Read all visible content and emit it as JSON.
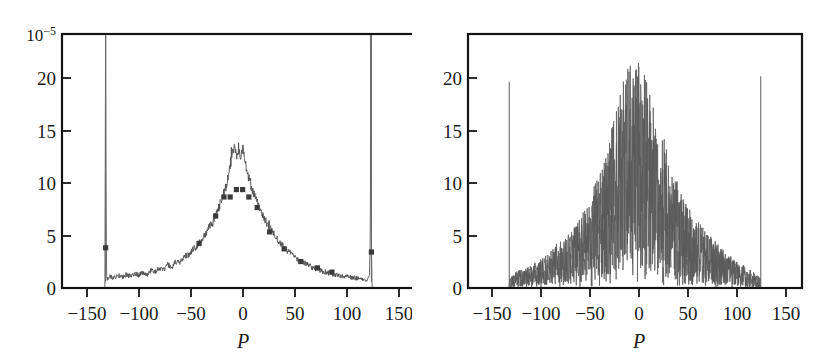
{
  "figure": {
    "background_color": "#ffffff",
    "trace_color": "#4a4a4a",
    "axis_color": "#141414"
  },
  "chart_data": [
    {
      "type": "line",
      "panel": "left",
      "title": "",
      "xlabel": "P",
      "ylabel": "",
      "scale_label": "10^-5",
      "scale_label_display": "10",
      "scale_exponent": "−5",
      "xlim": [
        -170,
        170
      ],
      "ylim": [
        0,
        24
      ],
      "xticks": [
        -150,
        -100,
        -50,
        0,
        50,
        100,
        150
      ],
      "xticklabels": [
        "−150",
        "−100",
        "−50",
        "0",
        "50",
        "100",
        "150"
      ],
      "yticks": [
        0,
        5,
        10,
        15,
        20
      ],
      "yticklabels": [
        "0",
        "5",
        "10",
        "15",
        "20"
      ],
      "grid": false,
      "legend": "none",
      "description": "Smooth noisy bell-shaped distribution peaking near P=0 at about 13-14, with a flat noisy plateau near 1 between the cutoffs, and two tall narrow spikes at P=-128 and P=+128 which run off the top of the frame. Square markers overlay the curve at several P values.",
      "x": [
        -170,
        -160,
        -150,
        -140,
        -132,
        -129,
        -128.5,
        -128,
        -127.5,
        -127,
        -126,
        -124,
        -120,
        -116,
        -112,
        -108,
        -104,
        -100,
        -96,
        -92,
        -88,
        -84,
        -80,
        -76,
        -72,
        -68,
        -64,
        -60,
        -56,
        -52,
        -48,
        -44,
        -40,
        -36,
        -32,
        -28,
        -24,
        -20,
        -16,
        -12,
        -8,
        -6,
        -4,
        -2,
        0,
        2,
        4,
        6,
        8,
        12,
        16,
        20,
        24,
        28,
        32,
        36,
        40,
        44,
        48,
        52,
        56,
        60,
        64,
        68,
        72,
        76,
        80,
        84,
        88,
        92,
        96,
        100,
        104,
        108,
        112,
        116,
        120,
        124,
        126,
        127,
        127.5,
        128,
        128.5,
        129,
        132,
        140,
        150,
        160,
        170
      ],
      "y": [
        0.05,
        0.05,
        0.05,
        0.06,
        0.08,
        0.5,
        6,
        24,
        6,
        1.0,
        0.9,
        1.1,
        0.95,
        1.2,
        1.0,
        1.3,
        1.1,
        1.4,
        1.2,
        1.5,
        1.3,
        1.7,
        1.5,
        1.9,
        1.7,
        2.2,
        2.0,
        2.5,
        2.4,
        3.0,
        3.1,
        3.6,
        4.0,
        4.6,
        5.0,
        5.8,
        6.4,
        7.3,
        8.4,
        9.6,
        11.5,
        12.6,
        13.3,
        12.4,
        13.0,
        12.2,
        13.4,
        12.1,
        11.0,
        9.6,
        8.8,
        7.6,
        6.7,
        6.0,
        5.4,
        4.8,
        4.3,
        3.8,
        3.4,
        3.1,
        2.8,
        2.5,
        2.3,
        2.1,
        1.9,
        1.8,
        1.6,
        1.5,
        1.4,
        1.3,
        1.2,
        1.1,
        1.05,
        1.0,
        0.95,
        0.9,
        0.85,
        0.8,
        1.0,
        5,
        24,
        5,
        0.6,
        0.08,
        0.06,
        0.05,
        0.05,
        0.05,
        0.05
      ],
      "markers_x": [
        -128,
        -38,
        -22,
        -14,
        -8,
        -2,
        4,
        10,
        18,
        30,
        44,
        60,
        76,
        90,
        128
      ],
      "markers_y": [
        3.8,
        4.2,
        6.8,
        8.6,
        8.6,
        9.3,
        9.3,
        8.6,
        7.6,
        5.3,
        3.7,
        2.5,
        1.9,
        1.5,
        3.4
      ]
    },
    {
      "type": "line",
      "panel": "right",
      "title": "",
      "xlabel": "P",
      "ylabel": "",
      "scale_label": "",
      "xlim": [
        -170,
        170
      ],
      "ylim": [
        0,
        24
      ],
      "xticks": [
        -150,
        -100,
        -50,
        0,
        50,
        100,
        150
      ],
      "xticklabels": [
        "−150",
        "−100",
        "−50",
        "0",
        "50",
        "100",
        "150"
      ],
      "yticks": [
        0,
        5,
        10,
        15,
        20
      ],
      "yticklabels": [
        "0",
        "5",
        "10",
        "15",
        "20"
      ],
      "grid": false,
      "legend": "none",
      "description": "Highly fluctuating dense spectrum forming a broad triangular envelope peaking near P=0 at about 21-22, decaying to near 0 at the cutoffs P=+/-128, with isolated tall narrow spikes at P=-128 (reaching ~19.5) and P=+128 (reaching ~20).",
      "envelope_x": [
        -128,
        -120,
        -110,
        -100,
        -90,
        -80,
        -70,
        -60,
        -50,
        -40,
        -30,
        -20,
        -10,
        -5,
        0,
        5,
        10,
        20,
        30,
        40,
        50,
        60,
        70,
        80,
        90,
        100,
        110,
        120,
        128
      ],
      "envelope_upper": [
        1.0,
        1.6,
        2.0,
        2.6,
        3.2,
        4.2,
        4.8,
        6.0,
        7.6,
        10.0,
        13.0,
        17.0,
        20.5,
        21.6,
        21.0,
        21.8,
        20.8,
        16.5,
        14.0,
        11.0,
        8.6,
        7.0,
        5.6,
        4.6,
        3.6,
        2.8,
        2.2,
        1.6,
        1.0
      ],
      "envelope_lower": [
        0.05,
        0.1,
        0.15,
        0.2,
        0.3,
        0.35,
        0.4,
        0.5,
        0.6,
        0.8,
        1.0,
        1.3,
        1.6,
        1.8,
        1.8,
        1.8,
        1.6,
        1.3,
        1.1,
        0.9,
        0.7,
        0.55,
        0.45,
        0.35,
        0.3,
        0.22,
        0.16,
        0.1,
        0.05
      ],
      "edge_spikes": [
        {
          "x": -128,
          "y": 19.5
        },
        {
          "x": 128,
          "y": 20.0
        }
      ]
    }
  ]
}
